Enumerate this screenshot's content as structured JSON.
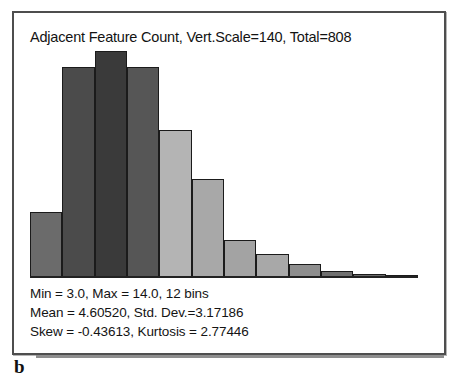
{
  "figure": {
    "panel_label": "b",
    "title": "Adjacent Feature Count, Vert.Scale=140, Total=808",
    "stats": {
      "line1": "Min = 3.0, Max = 14.0, 12 bins",
      "line2": "Mean = 4.60520, Std. Dev.=3.17186",
      "line3": "Skew = -0.43613, Kurtosis = 2.77446"
    }
  },
  "chart_data": {
    "type": "bar",
    "title": "Adjacent Feature Count, Vert.Scale=140, Total=808",
    "xlabel": "Adjacent Feature Count",
    "ylabel": "Count",
    "grid": false,
    "legend": "none",
    "vertical_scale": 140,
    "total": 808,
    "min": 3.0,
    "max": 14.0,
    "bins": 12,
    "mean": 4.6052,
    "std_dev": 3.17186,
    "skew": -0.43613,
    "kurtosis": 2.77446,
    "ylim": [
      0,
      140
    ],
    "categories": [
      "1",
      "2",
      "3",
      "4",
      "5",
      "6",
      "7",
      "8",
      "9",
      "10",
      "11",
      "12"
    ],
    "values": [
      40,
      129,
      139,
      129,
      90,
      60,
      23,
      14,
      8,
      4,
      2,
      1
    ],
    "bar_colors": [
      "#6b6b6b",
      "#4b4b4b",
      "#3a3a3a",
      "#565656",
      "#b4b4b4",
      "#a8a8a8",
      "#a3a3a3",
      "#a8a8a8",
      "#8e8e8e",
      "#707070",
      "#6a6a6a",
      "#4a4a4a"
    ],
    "bar_edge_color": "#1b1b1b",
    "background_color": "#ffffff",
    "text_color": "#141414"
  }
}
